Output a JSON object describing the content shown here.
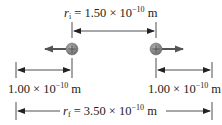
{
  "diagram": {
    "initial_separation": {
      "symbol": "r",
      "subscript": "i",
      "equals": " = ",
      "mantissa": "1.50 × 10",
      "exponent": "−10",
      "unit": " m"
    },
    "final_separation": {
      "symbol": "r",
      "subscript": "f",
      "equals": " = ",
      "mantissa": "3.50 × 10",
      "exponent": "−10",
      "unit": " m"
    },
    "left_displacement": {
      "mantissa": "1.00 × 10",
      "exponent": "−10",
      "unit": " m"
    },
    "right_displacement": {
      "mantissa": "1.00 × 10",
      "exponent": "−10",
      "unit": " m"
    },
    "particles": [
      {
        "charge": "+",
        "x": 72,
        "y": 49,
        "motion": "left"
      },
      {
        "charge": "+",
        "x": 156,
        "y": 49,
        "motion": "right"
      }
    ],
    "colors": {
      "particle": "#8a8a8a",
      "arrow": "#555555",
      "line": "#222222"
    }
  }
}
